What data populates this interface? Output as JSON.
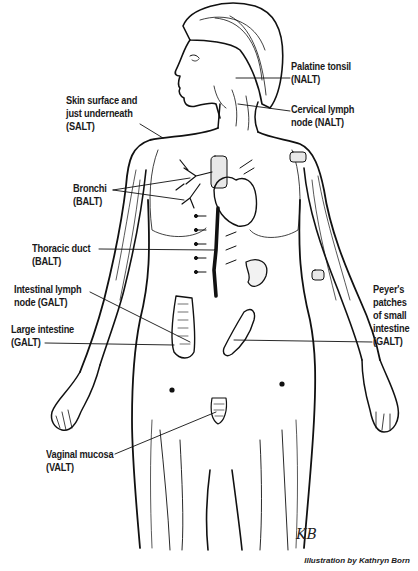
{
  "figure": {
    "labels": [
      {
        "id": "palatine-tonsil",
        "line1": "Palatine tonsil",
        "line2": "(NALT)"
      },
      {
        "id": "cervical-lymph-node",
        "line1": "Cervical lymph",
        "line2": "node (NALT)"
      },
      {
        "id": "skin",
        "line1": "Skin surface and",
        "line2": "just underneath",
        "line3": "(SALT)"
      },
      {
        "id": "bronchi",
        "line1": "Bronchi",
        "line2": "(BALT)"
      },
      {
        "id": "thoracic-duct",
        "line1": "Thoracic duct",
        "line2": "(BALT)"
      },
      {
        "id": "intestinal-lymph-node",
        "line1": "Intestinal lymph",
        "line2": "node (GALT)"
      },
      {
        "id": "large-intestine",
        "line1": "Large intestine",
        "line2": "(GALT)"
      },
      {
        "id": "peyers-patches",
        "line1": "Peyer's",
        "line2": "patches",
        "line3": "of small",
        "line4": "intestine",
        "line5": "(GALT)"
      },
      {
        "id": "vaginal-mucosa",
        "line1": "Vaginal mucosa",
        "line2": "(VALT)"
      }
    ],
    "signature": "KB",
    "credit": "Illustration by Kathryn Born"
  }
}
